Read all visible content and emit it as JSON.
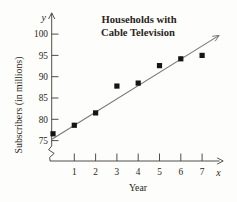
{
  "figure": {
    "title_line1": "Households with",
    "title_line2": "Cable Television"
  },
  "chart_data": {
    "type": "scatter",
    "title": "Households with Cable Television",
    "xlabel": "Year",
    "ylabel": "Subscribers (in millions)",
    "x_axis_letter": "x",
    "y_axis_letter": "y",
    "marker": "filled-square",
    "grid": false,
    "legend": "none",
    "y_axis_break": true,
    "x_ticks": [
      1,
      2,
      3,
      4,
      5,
      6,
      7
    ],
    "y_ticks": [
      75,
      80,
      85,
      90,
      95,
      100
    ],
    "xlim": [
      0,
      7.9
    ],
    "ylim": [
      75,
      100
    ],
    "points": [
      {
        "x": 0,
        "y": 76.6
      },
      {
        "x": 1,
        "y": 78.6
      },
      {
        "x": 2,
        "y": 81.5
      },
      {
        "x": 3,
        "y": 87.8
      },
      {
        "x": 4,
        "y": 88.5
      },
      {
        "x": 5,
        "y": 92.6
      },
      {
        "x": 6,
        "y": 94.2
      },
      {
        "x": 7,
        "y": 95.0
      }
    ],
    "trend_line": {
      "x1": -0.05,
      "y1": 75.3,
      "x2": 7.8,
      "y2": 99.7
    },
    "colors": {
      "points": "#151515",
      "trend_line": "#777777",
      "axis": "#3f3b38",
      "text": "#2b2520",
      "background": "#fdfdfb"
    }
  }
}
